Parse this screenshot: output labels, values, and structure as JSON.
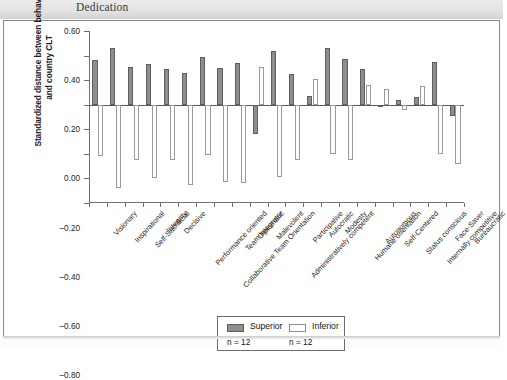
{
  "header": {
    "title": "Dedication"
  },
  "axes": {
    "y_title": "Standardized distance between behavior and country CLT",
    "y_ticks": [
      "0.60",
      "0.40",
      "0.20",
      "0.00",
      "-0.20",
      "-0.40",
      "-0.60",
      "-0.80"
    ]
  },
  "legend": {
    "superior_label": "Superior",
    "inferior_label": "Inferior",
    "superior_n": "n = 12",
    "inferior_n": "n = 12",
    "superior_color": "#8e8e8e",
    "inferior_color": "#ffffff"
  },
  "chart_data": {
    "type": "bar",
    "title": "Dedication",
    "xlabel": "",
    "ylabel": "Standardized distance between behavior and country CLT",
    "ylim": [
      -0.8,
      0.6
    ],
    "ytick_step": 0.2,
    "grid": false,
    "legend_position": "bottom-center",
    "categories": [
      "Visionary",
      "Inspirational",
      "Self-Sacrificial",
      "Integrity",
      "Decisive",
      "Performance oriented",
      "Collaborative Team Orientation",
      "Team integrator",
      "Diplomatic",
      "Malevolent",
      "Administratively competent",
      "Participative",
      "Autocratic",
      "Modesty",
      "Humane orientation",
      "Autonomous",
      "Self-Centered",
      "Status conscious",
      "Internally competitive",
      "Face-Saver",
      "Bureaucratic"
    ],
    "series": [
      {
        "name": "Superior",
        "n": 12,
        "color": "#8e8e8e",
        "values": [
          0.36,
          0.46,
          0.31,
          0.33,
          0.29,
          0.26,
          0.39,
          0.3,
          0.34,
          -0.24,
          0.44,
          0.25,
          0.07,
          0.46,
          0.37,
          0.29,
          0.0,
          0.04,
          0.06,
          0.35,
          -0.09
        ]
      },
      {
        "name": "Inferior",
        "n": 12,
        "color": "#ffffff",
        "values": [
          -0.42,
          -0.68,
          -0.45,
          -0.6,
          -0.45,
          -0.65,
          -0.41,
          -0.63,
          -0.64,
          0.31,
          -0.59,
          -0.45,
          0.21,
          -0.4,
          -0.45,
          0.16,
          0.13,
          -0.04,
          0.15,
          -0.4,
          -0.48
        ]
      }
    ]
  }
}
